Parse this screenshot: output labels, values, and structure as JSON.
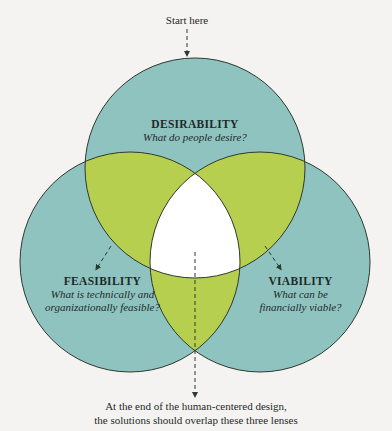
{
  "start": {
    "label": "Start here"
  },
  "circles": [
    {
      "id": "desirability",
      "title": "DESIRABILITY",
      "question": "What do people desire?"
    },
    {
      "id": "feasibility",
      "title": "FEASIBILITY",
      "question_line1": "What is technically and",
      "question_line2": "organizationally feasible?"
    },
    {
      "id": "viability",
      "title": "VIABILITY",
      "question_line1": "What can be",
      "question_line2": "financially viable?"
    }
  ],
  "caption": {
    "line1": "At the end of the human-centered design,",
    "line2": "the solutions should overlap these three lenses"
  },
  "colors": {
    "circle_fill": "#8fc3c0",
    "overlap_fill": "#b6cf4f",
    "center_fill": "#ffffff",
    "stroke": "#2d3a2e",
    "background": "#f4f3f1"
  }
}
